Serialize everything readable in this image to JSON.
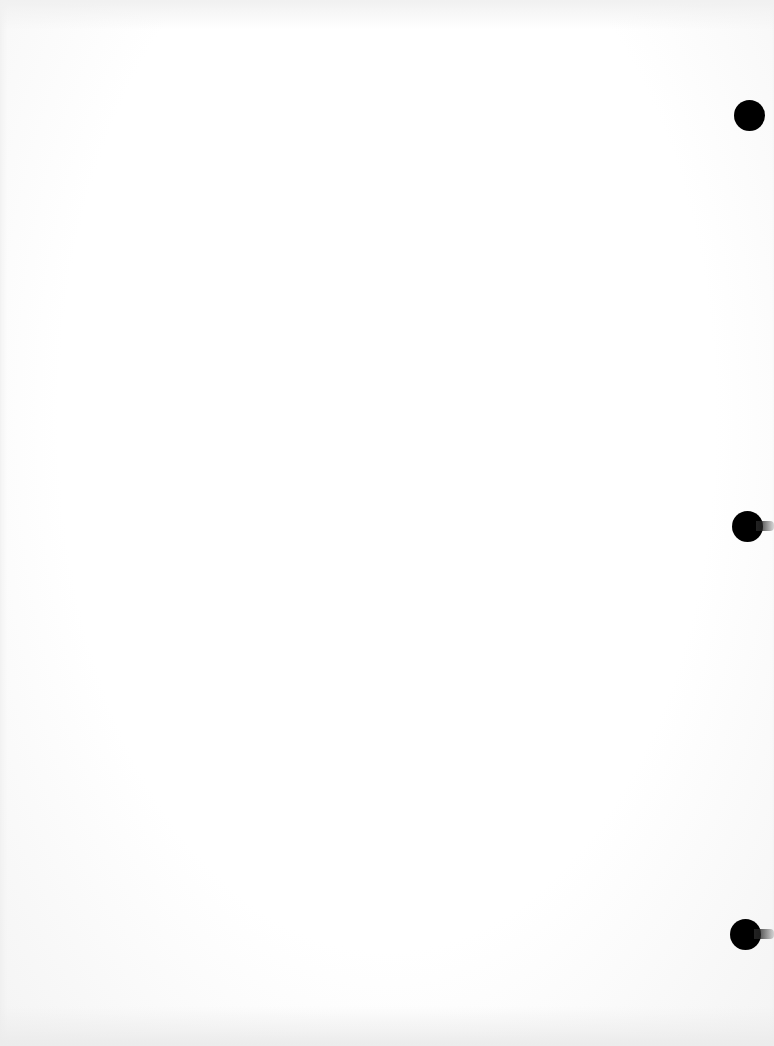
{
  "page": {
    "type": "blank-scanned-page",
    "background_color": "#ffffff",
    "text": ""
  },
  "punch_holes": [
    {
      "name": "punch-hole-top",
      "x": 750,
      "y": 115,
      "diameter": 31,
      "color": "#000000"
    },
    {
      "name": "punch-hole-middle",
      "x": 747,
      "y": 526,
      "diameter": 31,
      "color": "#000000"
    },
    {
      "name": "punch-hole-bottom",
      "x": 746,
      "y": 934,
      "diameter": 31,
      "color": "#000000"
    }
  ]
}
